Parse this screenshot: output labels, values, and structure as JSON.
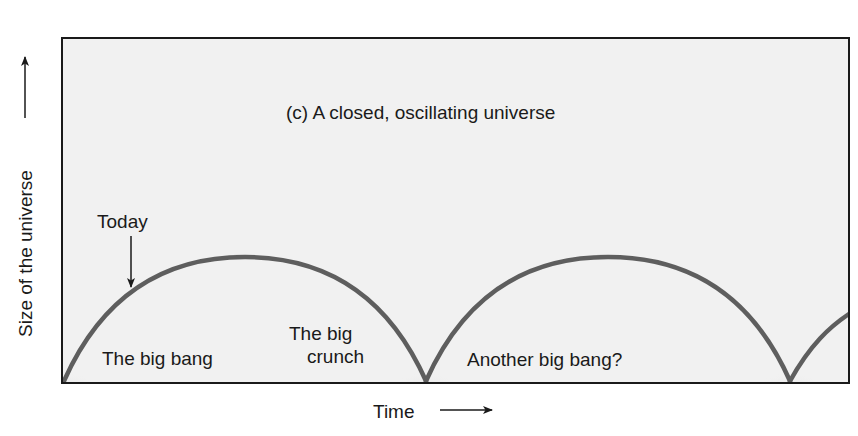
{
  "diagram": {
    "title": "(c) A closed, oscillating universe",
    "y_axis_label": "Size of the universe",
    "x_axis_label": "Time",
    "annotations": {
      "today": "Today",
      "big_bang": "The big bang",
      "big_crunch_line1": "The big",
      "big_crunch_line2": "crunch",
      "another_big_bang": "Another big bang?"
    },
    "colors": {
      "background": "#ffffff",
      "panel_fill": "#f1f1f1",
      "frame": "#1a1a1a",
      "curve": "#5e5e5e",
      "singularity_glow": "#6a6a6a",
      "text": "#1a1a1a"
    },
    "cycles": [
      {
        "start_x": 64,
        "end_x": 426,
        "peak_y": 257,
        "label": "first cycle"
      },
      {
        "start_x": 426,
        "end_x": 790,
        "peak_y": 257,
        "label": "second cycle"
      },
      {
        "start_x": 790,
        "end_x": 849,
        "peak_y": 257,
        "label": "third cycle (partial)"
      }
    ]
  }
}
